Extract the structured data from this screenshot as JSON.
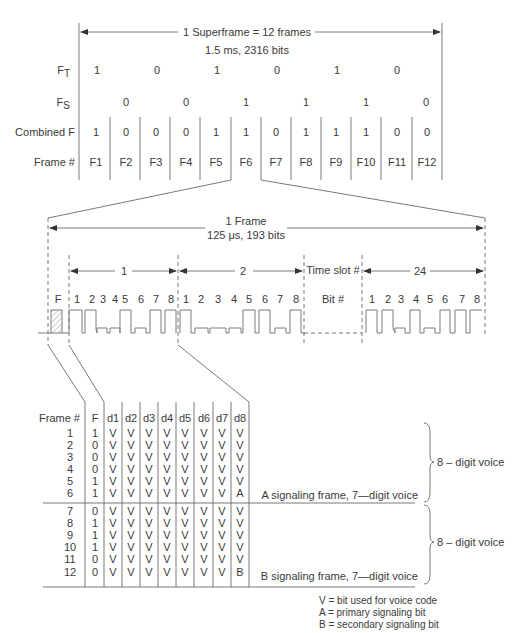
{
  "superframe": {
    "title": "1 Superframe = 12 frames",
    "subtitle": "1.5 ms, 2316 bits",
    "rows": {
      "ft_label": "F",
      "ft_sub": "T",
      "fs_label": "F",
      "fs_sub": "S",
      "combined_label": "Combined F",
      "frame_label": "Frame #"
    },
    "ft_values": [
      "1",
      "0",
      "1",
      "0",
      "1",
      "0"
    ],
    "fs_values": [
      "0",
      "0",
      "1",
      "1",
      "1",
      "0"
    ],
    "combined_values": [
      "1",
      "0",
      "0",
      "0",
      "1",
      "1",
      "0",
      "1",
      "1",
      "1",
      "0",
      "0"
    ],
    "frames": [
      "F1",
      "F2",
      "F3",
      "F4",
      "F5",
      "F6",
      "F7",
      "F8",
      "F9",
      "F10",
      "F11",
      "F12"
    ]
  },
  "frame": {
    "title": "1 Frame",
    "subtitle": "125 μs, 193 bits",
    "slots": [
      "1",
      "2",
      "24"
    ],
    "timeslot_label": "Time slot #",
    "bit_label": "Bit #",
    "f_label": "F",
    "bits": [
      "1",
      "2",
      "3",
      "4",
      "5",
      "6",
      "7",
      "8"
    ]
  },
  "table": {
    "headers": [
      "Frame #",
      "F",
      "d1",
      "d2",
      "d3",
      "d4",
      "d5",
      "d6",
      "d7",
      "d8"
    ],
    "rows": [
      [
        "1",
        "1",
        "V",
        "V",
        "V",
        "V",
        "V",
        "V",
        "V",
        "V"
      ],
      [
        "2",
        "0",
        "V",
        "V",
        "V",
        "V",
        "V",
        "V",
        "V",
        "V"
      ],
      [
        "3",
        "0",
        "V",
        "V",
        "V",
        "V",
        "V",
        "V",
        "V",
        "V"
      ],
      [
        "4",
        "0",
        "V",
        "V",
        "V",
        "V",
        "V",
        "V",
        "V",
        "V"
      ],
      [
        "5",
        "1",
        "V",
        "V",
        "V",
        "V",
        "V",
        "V",
        "V",
        "V"
      ],
      [
        "6",
        "1",
        "V",
        "V",
        "V",
        "V",
        "V",
        "V",
        "V",
        "A"
      ],
      [
        "7",
        "0",
        "V",
        "V",
        "V",
        "V",
        "V",
        "V",
        "V",
        "V"
      ],
      [
        "8",
        "1",
        "V",
        "V",
        "V",
        "V",
        "V",
        "V",
        "V",
        "V"
      ],
      [
        "9",
        "1",
        "V",
        "V",
        "V",
        "V",
        "V",
        "V",
        "V",
        "V"
      ],
      [
        "10",
        "1",
        "V",
        "V",
        "V",
        "V",
        "V",
        "V",
        "V",
        "V"
      ],
      [
        "11",
        "0",
        "V",
        "V",
        "V",
        "V",
        "V",
        "V",
        "V",
        "V"
      ],
      [
        "12",
        "0",
        "V",
        "V",
        "V",
        "V",
        "V",
        "V",
        "V",
        "B"
      ]
    ],
    "a_note": "A signaling frame, 7—digit voice",
    "b_note": "B signaling frame, 7—digit voice",
    "brace_label_1": "8 – digit voice",
    "brace_label_2": "8 – digit voice"
  },
  "legend": [
    "V = bit used for voice code",
    "A = primary signaling bit",
    "B = secondary signaling bit"
  ]
}
